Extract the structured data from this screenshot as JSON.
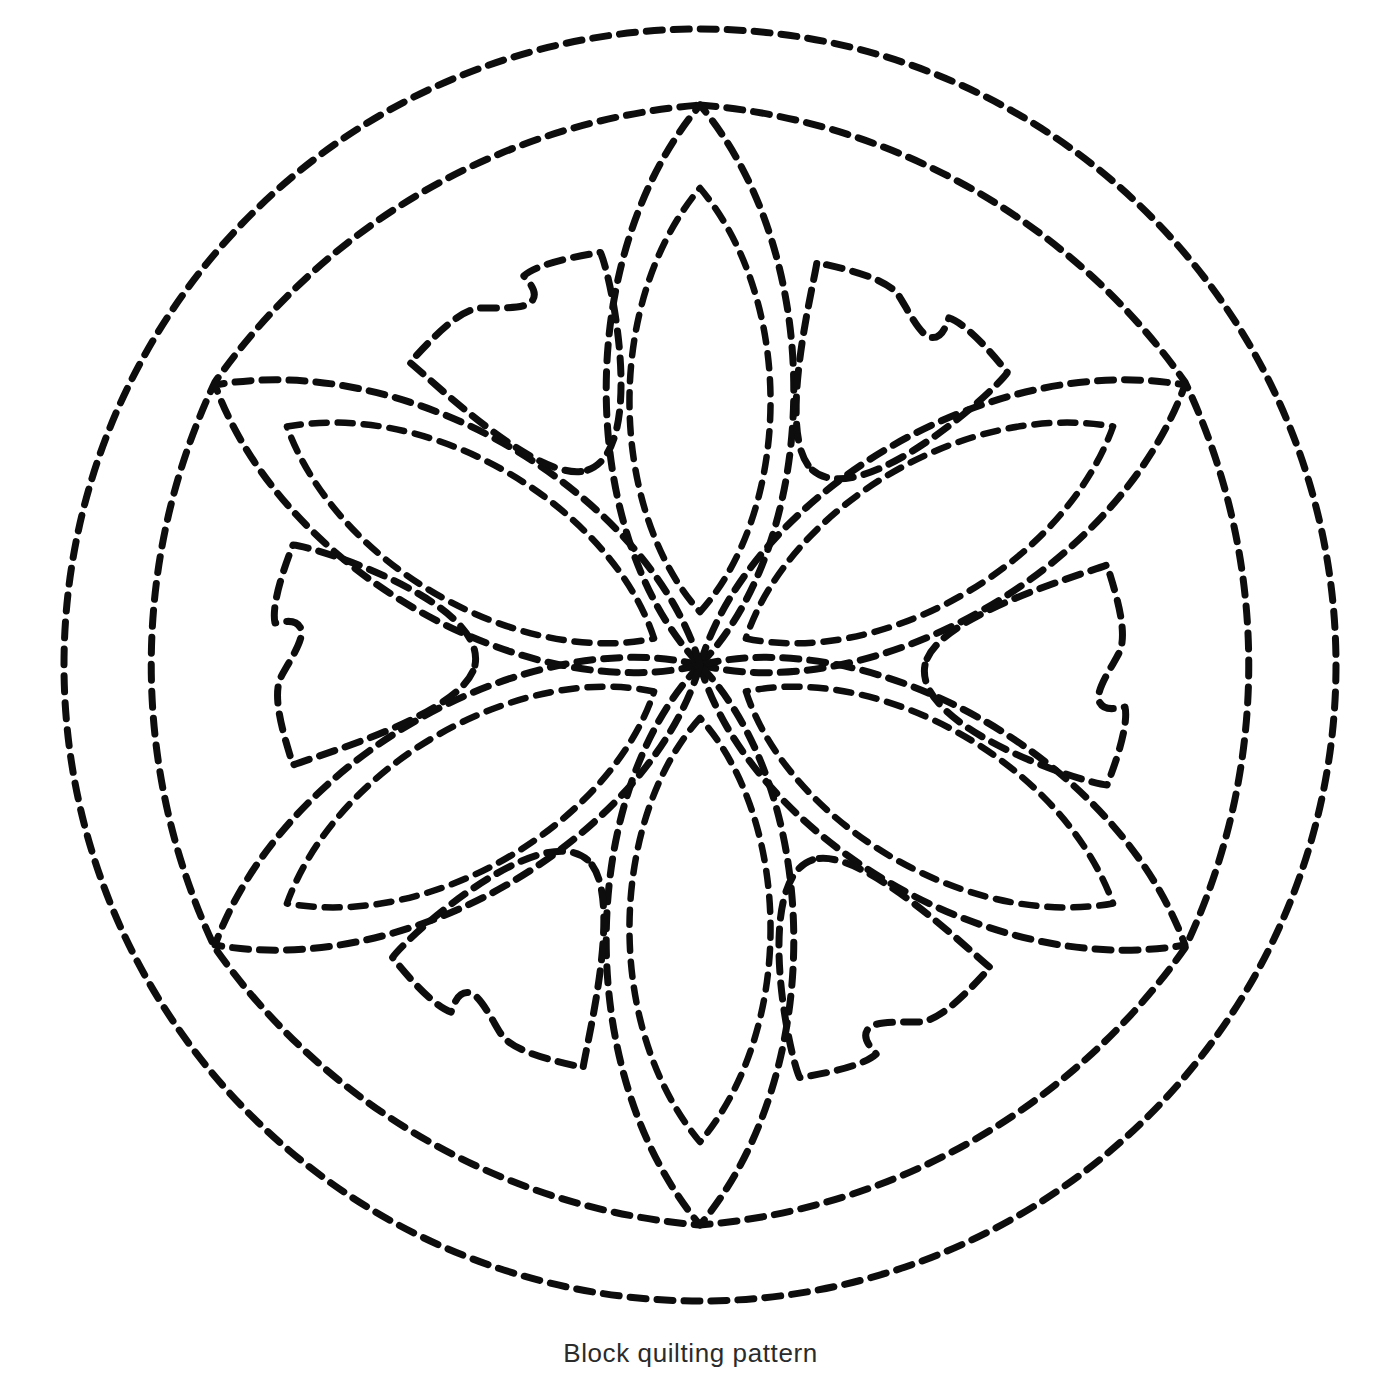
{
  "document": {
    "title": "Block quilting pattern",
    "caption": "Block quilting pattern",
    "background_color": "#ffffff",
    "ink_color": "#0d0d0d"
  },
  "figure": {
    "name": "block-quilting-pattern-medallion",
    "style": "dashed running-stitch outline",
    "stitch": {
      "dash_length_px": 16,
      "gap_length_px": 11,
      "stroke_width_px": 7,
      "line_cap": "round",
      "color": "#0d0d0d"
    },
    "geometry": {
      "center_x": 700,
      "center_y": 665,
      "outer_ring_radius": 636,
      "inner_ring_radius": 572,
      "inner_ring_cusp_radius": 560,
      "petal_count": 6,
      "petal_tip_radius": 560,
      "petal_half_width_deg": 26,
      "inner_petal_inset": 0.82,
      "trefoil_count": 6,
      "symmetry": "6-fold rotational"
    },
    "elements": [
      {
        "name": "outer-circle-ring",
        "type": "circle",
        "description": "outermost dashed circle"
      },
      {
        "name": "inner-scalloped-ring",
        "type": "scalloped-hexagon",
        "description": "six dashed arcs meeting at cusps between petal tips"
      },
      {
        "name": "petal-outer",
        "type": "lens",
        "count": 6,
        "description": "large vesica petals radiating from centre to inner ring"
      },
      {
        "name": "petal-inner",
        "type": "lens",
        "count": 6,
        "description": "smaller echo lens inside each petal"
      },
      {
        "name": "trefoil-wedge",
        "type": "curved-triangle",
        "count": 6,
        "description": "notched triangular motifs filling the gaps between petals"
      }
    ]
  }
}
